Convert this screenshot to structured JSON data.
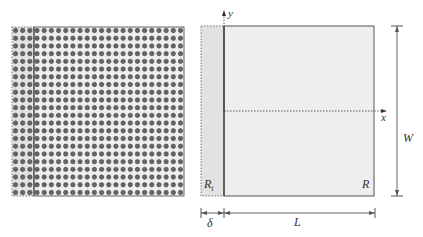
{
  "figure": {
    "left_panel": {
      "description": "array of circular particles in strip",
      "rows": 22,
      "cols": 24,
      "border_cols": 3
    },
    "right_panel": {
      "axis_labels": {
        "x": "x",
        "y": "y"
      },
      "region_labels": {
        "boundary": "R",
        "boundary_sub": "t",
        "main": "R"
      },
      "dimensions": {
        "width": "W",
        "length": "L",
        "delta": "δ"
      }
    },
    "colors": {
      "fill_main": "#eeeeee",
      "fill_boundary": "#e2e2e2",
      "stroke": "#555555",
      "dot_fill": "#666666",
      "dot_ring": "#444444"
    }
  }
}
